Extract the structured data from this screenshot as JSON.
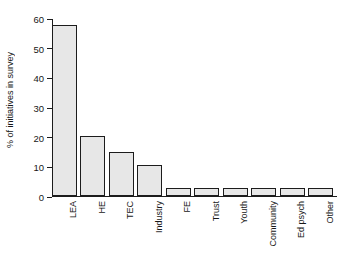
{
  "chart_data": {
    "type": "bar",
    "title": "",
    "subtitle": "",
    "xlabel": "",
    "ylabel": "% of initiatives in survey",
    "categories": [
      "LEA",
      "HE",
      "TEC",
      "Industry",
      "FE",
      "Trust",
      "Youth",
      "Community",
      "Ed psych",
      "Other"
    ],
    "values": [
      57.8,
      20.2,
      14.7,
      10.3,
      2.6,
      2.6,
      2.6,
      2.6,
      2.6,
      2.6
    ],
    "ylim": [
      0,
      60
    ],
    "yticks": [
      0,
      10,
      20,
      30,
      40,
      50,
      60
    ],
    "ytick_labels": [
      "0",
      "10",
      "20",
      "30",
      "40",
      "50",
      "60"
    ],
    "grid": false,
    "legend": false,
    "legend_position": "none",
    "bar_fill_color": "#e7e7e7",
    "bar_edge_color": "#1c1c1c",
    "axis_color": "#1c1c1c",
    "background_color": "#ffffff",
    "xlabel_rotation": -90
  }
}
